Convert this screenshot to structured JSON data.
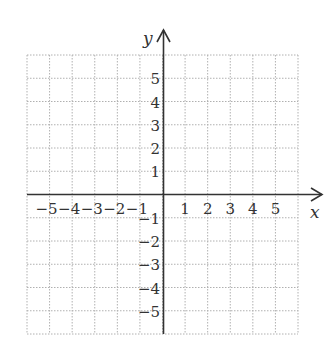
{
  "chart_data": {
    "type": "scatter",
    "title": "",
    "xlabel": "x",
    "ylabel": "y",
    "xlim": [
      -6,
      6
    ],
    "ylim": [
      -6,
      6
    ],
    "grid": true,
    "grid_style": "dotted",
    "x_ticks": [
      -5,
      -4,
      -3,
      -2,
      -1,
      1,
      2,
      3,
      4,
      5
    ],
    "y_ticks": [
      -5,
      -4,
      -3,
      -2,
      -1,
      1,
      2,
      3,
      4,
      5
    ],
    "x_tick_labels": [
      "−5",
      "−4",
      "−3",
      "−2",
      "−1",
      "1",
      "2",
      "3",
      "4",
      "5"
    ],
    "y_tick_labels": [
      "−5",
      "−4",
      "−3",
      "−2",
      "−1",
      "1",
      "2",
      "3",
      "4",
      "5"
    ],
    "series": [],
    "legend": null
  },
  "axes": {
    "x_label": "x",
    "y_label": "y"
  },
  "colors": {
    "axis": "#333333",
    "grid": "#b0b0b0",
    "text": "#333333"
  }
}
